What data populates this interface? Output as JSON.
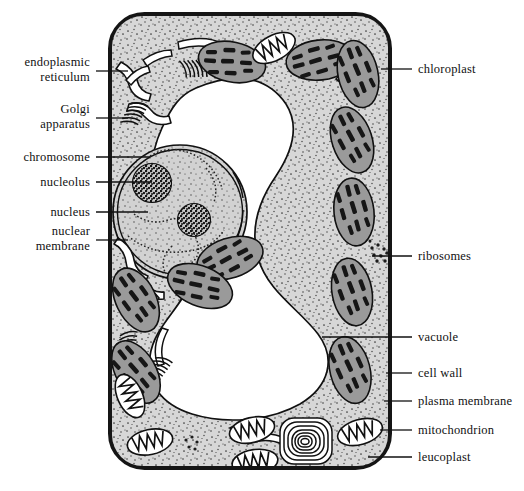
{
  "diagram": {
    "colors": {
      "cell_wall": "#151515",
      "plasma_membrane": "#6f6f6f",
      "cytoplasm": "#d7d7d7",
      "stipple": "#3a3a3a",
      "vacuole": "#ffffff",
      "chloroplast_fill": "#9a9a9a",
      "chloroplast_grana": "#1a1a1a",
      "nucleus_fill": "#d2d2d2",
      "nucleolus": "#202020",
      "outline": "#111111",
      "leader_line": "#111111",
      "text": "#111111"
    },
    "labels_left": [
      {
        "id": "endoplasmic-reticulum",
        "text": "endoplasmic\nreticulum",
        "line1": "endoplasmic",
        "line2": "reticulum",
        "x": 10,
        "y": 56,
        "leader_y": 71,
        "leader_x1": 96,
        "leader_x2": 128
      },
      {
        "id": "golgi-apparatus",
        "text": "Golgi\napparatus",
        "line1": "Golgi",
        "line2": "apparatus",
        "x": 10,
        "y": 101,
        "leader_y": 118,
        "leader_x1": 96,
        "leader_x2": 128
      },
      {
        "id": "chromosome",
        "text": "chromosome",
        "x": 10,
        "y": 150,
        "leader_y": 157,
        "leader_x1": 96,
        "leader_x2": 150
      },
      {
        "id": "nucleolus",
        "text": "nucleolus",
        "x": 10,
        "y": 175,
        "leader_y": 182,
        "leader_x1": 96,
        "leader_x2": 152
      },
      {
        "id": "nucleus",
        "text": "nucleus",
        "x": 10,
        "y": 205,
        "leader_y": 212,
        "leader_x1": 96,
        "leader_x2": 148
      },
      {
        "id": "nuclear-membrane",
        "text": "nuclear\nmembrane",
        "line1": "nuclear",
        "line2": "membrane",
        "x": 10,
        "y": 223,
        "leader_y": 240,
        "leader_x1": 96,
        "leader_x2": 128
      }
    ],
    "labels_right": [
      {
        "id": "chloroplast",
        "text": "chloroplast",
        "x": 418,
        "y": 62,
        "leader_y": 69,
        "leader_x1": 381,
        "leader_x2": 412
      },
      {
        "id": "ribosomes",
        "text": "ribosomes",
        "x": 418,
        "y": 249,
        "leader_y": 256,
        "leader_x1": 372,
        "leader_x2": 412
      },
      {
        "id": "vacuole",
        "text": "vacuole",
        "x": 418,
        "y": 330,
        "leader_y": 337,
        "leader_x1": 322,
        "leader_x2": 412
      },
      {
        "id": "cell-wall",
        "text": "cell  wall",
        "x": 418,
        "y": 366,
        "leader_y": 373,
        "leader_x1": 386,
        "leader_x2": 412
      },
      {
        "id": "plasma-membrane",
        "text": "plasma  membrane",
        "x": 418,
        "y": 394,
        "leader_y": 401,
        "leader_x1": 384,
        "leader_x2": 412
      },
      {
        "id": "mitochondrion",
        "text": "mitochondrion",
        "x": 418,
        "y": 423,
        "leader_y": 430,
        "leader_x1": 380,
        "leader_x2": 412
      },
      {
        "id": "leucoplast",
        "text": "leucoplast",
        "x": 418,
        "y": 452,
        "leader_y": 457,
        "leader_x1": 368,
        "leader_x2": 412
      }
    ],
    "structures": {
      "cell_wall_box": {
        "x": 108,
        "y": 12,
        "width": 284,
        "height": 458,
        "corner_radius": 34,
        "stroke_width": 9
      },
      "nucleus": {
        "cx": 180,
        "cy": 212,
        "rx": 66,
        "ry": 66
      },
      "nucleoli": [
        {
          "cx": 152,
          "cy": 182,
          "r": 19
        },
        {
          "cx": 193,
          "cy": 219,
          "r": 16
        }
      ],
      "chloroplast_count": 11,
      "mitochondria_count": 6,
      "leucoplast": {
        "cx": 306,
        "cy": 441,
        "rx": 27,
        "ry": 24,
        "rings": 7
      }
    }
  }
}
